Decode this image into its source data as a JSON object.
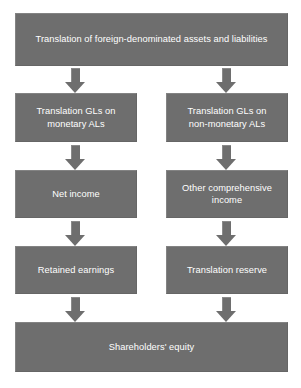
{
  "diagram": {
    "colors": {
      "box_fill": "#6e6e6e",
      "box_text": "#ffffff",
      "arrow_fill": "#6e6e6e",
      "background": "#ffffff"
    },
    "nodes": {
      "root": "Translation of foreign-denominated assets and liabilities",
      "left_gl": "Translation GLs on\nmonetary ALs",
      "right_gl": "Translation GLs on\nnon-monetary ALs",
      "left_income": "Net income",
      "right_income": "Other comprehensive\nincome",
      "left_equity": "Retained earnings",
      "right_equity": "Translation reserve",
      "final": "Shareholders' equity"
    },
    "arrows": [
      {
        "name": "root-to-left-gl",
        "from": "root",
        "to": "left_gl",
        "direction": "down"
      },
      {
        "name": "root-to-right-gl",
        "from": "root",
        "to": "right_gl",
        "direction": "down"
      },
      {
        "name": "left-gl-to-net-income",
        "from": "left_gl",
        "to": "left_income",
        "direction": "down"
      },
      {
        "name": "right-gl-to-oci",
        "from": "right_gl",
        "to": "right_income",
        "direction": "down"
      },
      {
        "name": "net-income-to-retained-earnings",
        "from": "left_income",
        "to": "left_equity",
        "direction": "down"
      },
      {
        "name": "oci-to-translation-reserve",
        "from": "right_income",
        "to": "right_equity",
        "direction": "down"
      },
      {
        "name": "retained-earnings-to-equity",
        "from": "left_equity",
        "to": "final",
        "direction": "down"
      },
      {
        "name": "translation-reserve-to-equity",
        "from": "right_equity",
        "to": "final",
        "direction": "down"
      }
    ]
  }
}
